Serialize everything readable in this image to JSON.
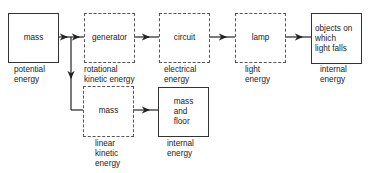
{
  "diagram": {
    "nodes": [
      {
        "id": "mass-source",
        "text": "mass",
        "style": "solid",
        "caption": "potential\nenergy"
      },
      {
        "id": "generator",
        "text": "generator",
        "style": "dashed",
        "caption": "rotational\nkinetic energy"
      },
      {
        "id": "circuit",
        "text": "circuit",
        "style": "dashed",
        "caption": "electrical\nenergy"
      },
      {
        "id": "lamp",
        "text": "lamp",
        "style": "dashed",
        "caption": "light\nenergy"
      },
      {
        "id": "objects",
        "text": "objects on\nwhich\nlight falls",
        "style": "solid",
        "caption": "internal\nenergy"
      },
      {
        "id": "mass-linear",
        "text": "mass",
        "style": "dashed",
        "caption": "linear\nkinetic\nenergy"
      },
      {
        "id": "mass-floor",
        "text": "mass\nand\nfloor",
        "style": "solid",
        "caption": "internal\nenergy"
      }
    ],
    "edges": [
      {
        "from": "mass-source",
        "to": "generator"
      },
      {
        "from": "generator",
        "to": "circuit"
      },
      {
        "from": "circuit",
        "to": "lamp"
      },
      {
        "from": "lamp",
        "to": "objects"
      },
      {
        "from": "mass-source",
        "to": "mass-linear"
      },
      {
        "from": "mass-linear",
        "to": "mass-floor"
      }
    ]
  }
}
